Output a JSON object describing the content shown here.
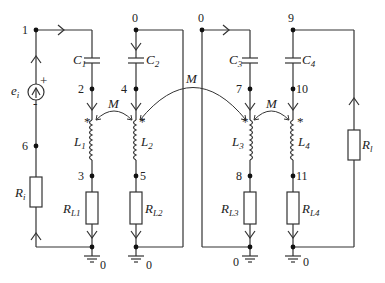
{
  "diagram": {
    "type": "circuit-schematic",
    "nodes": {
      "n1": "1",
      "n2": "2",
      "n3": "3",
      "n4": "4",
      "n5": "5",
      "n6": "6",
      "n7": "7",
      "n8": "8",
      "n9": "9",
      "n10": "10",
      "n11": "11",
      "g_top2": "0",
      "g_top3": "0",
      "g_b1": "0",
      "g_b2": "0",
      "g_b3": "0",
      "g_b4": "0"
    },
    "components": {
      "source": {
        "name": "e",
        "sub": "i"
      },
      "Ri": {
        "name": "R",
        "sub": "i"
      },
      "C1": {
        "name": "C",
        "sub": "1"
      },
      "C2": {
        "name": "C",
        "sub": "2"
      },
      "C3": {
        "name": "C",
        "sub": "3"
      },
      "C4": {
        "name": "C",
        "sub": "4"
      },
      "L1": {
        "name": "L",
        "sub": "1"
      },
      "L2": {
        "name": "L",
        "sub": "2"
      },
      "L3": {
        "name": "L",
        "sub": "3"
      },
      "L4": {
        "name": "L",
        "sub": "4"
      },
      "RL1": {
        "name": "R",
        "sub": "L1"
      },
      "RL2": {
        "name": "R",
        "sub": "L2"
      },
      "RL3": {
        "name": "R",
        "sub": "L3"
      },
      "RL4": {
        "name": "R",
        "sub": "L4"
      },
      "Rl": {
        "name": "R",
        "sub": "l"
      }
    },
    "coupling": {
      "M12": "M",
      "M23": "M",
      "M34": "M"
    },
    "dot_marker": "*",
    "source_polarity": {
      "plus": "+",
      "minus": "-"
    }
  }
}
